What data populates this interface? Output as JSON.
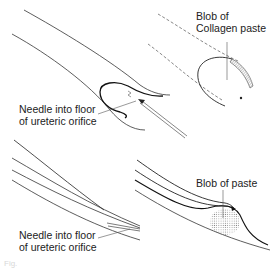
{
  "diagram": {
    "panels": [
      {
        "id": "top-left",
        "label_lines": [
          "Needle into floor",
          "of ureteric orifice"
        ]
      },
      {
        "id": "top-right",
        "label_lines": [
          "Blob of",
          "Collagen paste"
        ]
      },
      {
        "id": "bottom-left",
        "label_lines": [
          "Needle into floor",
          "of ureteric orifice"
        ]
      },
      {
        "id": "bottom-right",
        "label_lines": [
          "Blob of paste"
        ]
      }
    ],
    "caption": "Fig."
  }
}
